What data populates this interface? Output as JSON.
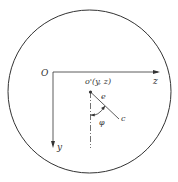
{
  "diagram": {
    "labels": {
      "origin": "O",
      "z_axis": "z",
      "y_axis": "y",
      "center_point": "o'(y, z)",
      "eccentricity": "e",
      "angle": "φ",
      "point_c": "c"
    },
    "colors": {
      "stroke": "#333333",
      "background": "#ffffff"
    }
  }
}
